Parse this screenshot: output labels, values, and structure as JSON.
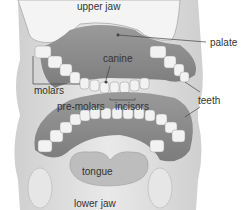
{
  "diagram": {
    "labels": {
      "upper_jaw": "upper jaw",
      "palate": "palate",
      "canine": "canine",
      "molars": "molars",
      "pre_molars": "pre-molars",
      "incisors": "incisors",
      "teeth": "teeth",
      "tongue": "tongue",
      "lower_jaw": "lower jaw"
    }
  }
}
